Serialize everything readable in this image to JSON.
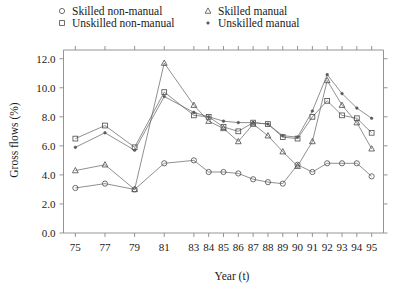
{
  "chart_data": {
    "type": "line",
    "title": "",
    "xlabel": "Year (t)",
    "ylabel": "Gross flows (%)",
    "xlim": [
      74.2,
      95.8
    ],
    "ylim": [
      0.0,
      12.6
    ],
    "grid": false,
    "legend_position": "top",
    "y_ticks": [
      "0.0",
      "2.0",
      "4.0",
      "6.0",
      "8.0",
      "10.0",
      "12.0"
    ],
    "y_tick_values": [
      0.0,
      2.0,
      4.0,
      6.0,
      8.0,
      10.0,
      12.0
    ],
    "x_tick_labels": [
      "75",
      "77",
      "79",
      "81",
      "83",
      "84",
      "85",
      "86",
      "87",
      "88",
      "89",
      "90",
      "91",
      "92",
      "93",
      "94",
      "95"
    ],
    "x_tick_values": [
      75,
      77,
      79,
      81,
      83,
      84,
      85,
      86,
      87,
      88,
      89,
      90,
      91,
      92,
      93,
      94,
      95
    ],
    "x": [
      75,
      77,
      79,
      81,
      83,
      84,
      85,
      86,
      87,
      88,
      89,
      90,
      91,
      92,
      93,
      94,
      95
    ],
    "series": [
      {
        "name": "Skilled non-manual",
        "marker": "circle",
        "values": [
          3.1,
          3.4,
          3.0,
          4.8,
          5.0,
          4.2,
          4.2,
          4.1,
          3.7,
          3.5,
          3.4,
          4.7,
          4.2,
          4.8,
          4.8,
          4.8,
          3.9
        ]
      },
      {
        "name": "Unskilled non-manual",
        "marker": "square",
        "values": [
          6.5,
          7.4,
          5.9,
          9.7,
          8.1,
          8.0,
          7.3,
          7.0,
          7.6,
          7.5,
          6.6,
          6.5,
          8.0,
          9.1,
          8.1,
          7.9,
          6.9
        ]
      },
      {
        "name": "Skilled manual",
        "marker": "triangle",
        "values": [
          4.3,
          4.7,
          3.0,
          11.7,
          8.8,
          7.7,
          7.2,
          6.3,
          7.5,
          6.7,
          5.6,
          4.6,
          6.3,
          10.5,
          8.8,
          7.6,
          5.8
        ]
      },
      {
        "name": "Unskilled manual",
        "marker": "dot",
        "values": [
          5.9,
          6.9,
          5.7,
          9.4,
          8.3,
          8.0,
          7.7,
          7.6,
          7.6,
          7.5,
          6.7,
          6.6,
          8.4,
          10.9,
          9.6,
          8.6,
          7.9
        ]
      }
    ],
    "legend": [
      {
        "label": "Skilled non-manual",
        "marker": "circle"
      },
      {
        "label": "Unskilled non-manual",
        "marker": "square"
      },
      {
        "label": "Skilled manual",
        "marker": "triangle"
      },
      {
        "label": "Unskilled manual",
        "marker": "dot"
      }
    ],
    "colors": {
      "line": "#6b6b6b",
      "marker": "#4a4a4a",
      "axis": "#888888",
      "text": "#1a1a1a",
      "background": "#ffffff"
    }
  }
}
